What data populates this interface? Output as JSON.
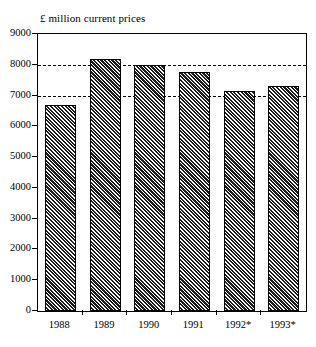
{
  "chart_data": {
    "type": "bar",
    "title": "£ million current prices",
    "xlabel": "",
    "ylabel": "",
    "categories": [
      "1988",
      "1989",
      "1990",
      "1991",
      "1992*",
      "1993*"
    ],
    "values": [
      6700,
      8180,
      7990,
      7750,
      7150,
      7300
    ],
    "ylim": [
      0,
      9000
    ],
    "y_ticks": [
      0,
      1000,
      2000,
      3000,
      4000,
      5000,
      6000,
      7000,
      8000,
      9000
    ],
    "y_tick_labels": [
      "0",
      "1000",
      "2000",
      "3000",
      "4000",
      "5000",
      "6000",
      "7000",
      "8000",
      "9000"
    ],
    "gridlines": [
      7000,
      8000
    ],
    "grid": "dashed-horizontal-partial",
    "legend": "none",
    "series": [
      {
        "name": "£ million current prices",
        "values": [
          6700,
          8180,
          7990,
          7750,
          7150,
          7300
        ]
      }
    ],
    "bar_fill": "diagonal-hatch",
    "bar_color": "#1c1c1c",
    "frame_color": "#000000",
    "background_color": "#ffffff",
    "annotations": [
      "* denotes provisional or estimated figures"
    ]
  }
}
